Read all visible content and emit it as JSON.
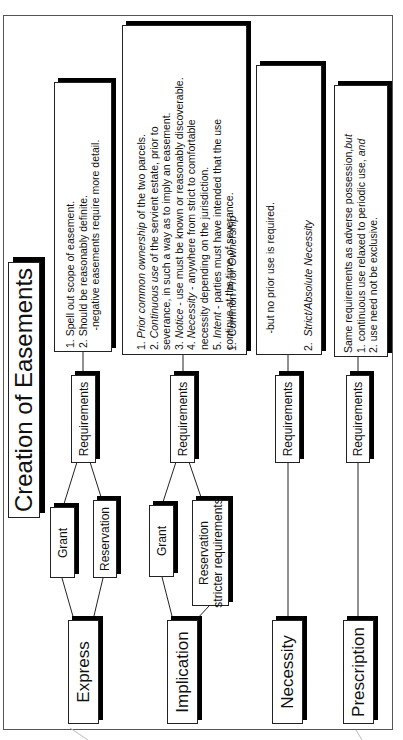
{
  "title": "Creation of Easements",
  "methods": [
    {
      "id": "express",
      "label": "Express",
      "requirements_label": "Requirements",
      "subtypes": [
        {
          "label": "Grant"
        },
        {
          "label": "Reservation"
        }
      ],
      "requirements_text": [
        "1.  Spell out scope of easement.",
        "2.  Should be reasonably definite.",
        "      -negative easements require more detail."
      ]
    },
    {
      "id": "implication",
      "label": "Implication",
      "requirements_label": "Requirements",
      "subtypes": [
        {
          "label": "Grant"
        },
        {
          "label": "Reservation",
          "sublabel": "stricter requirements"
        }
      ],
      "requirements_text": [
        {
          "num": "1. ",
          "italic": "Prior common ownership",
          "rest": " of the two parcels."
        },
        {
          "num": "2. ",
          "italic": "Continuous use",
          "rest": " of the servient estate, prior to"
        },
        {
          "num": "",
          "italic": "",
          "rest": "severance, in such a way as to imply an  easement."
        },
        {
          "num": "3. ",
          "italic": "Notice",
          "rest": " - use must be known or reasonably discoverable."
        },
        {
          "num": "4. ",
          "italic": "Necessity",
          "rest": " - anywhere from strict to comfortable"
        },
        {
          "num": "",
          "italic": "",
          "rest": "necessity depending on the jurisdiction."
        },
        {
          "num": "5. ",
          "italic": "Intent",
          "rest": " - parties must have intended that the use"
        },
        {
          "num": "",
          "italic": "",
          "rest": "continue at the time of severance."
        }
      ]
    },
    {
      "id": "necessity",
      "label": "Necessity",
      "requirements_label": "Requirements",
      "requirements_text": [
        {
          "num": "1.  ",
          "plain": "Common ",
          "italic": "Prior Ownership",
          "rest": ""
        },
        {
          "num": "",
          "plain": "      -but no prior use is required.",
          "italic": "",
          "rest": ""
        },
        {
          "num": "2.  ",
          "plain": "",
          "italic": "Strict/Absolute Necessity",
          "rest": ""
        },
        {
          "num": "",
          "plain": "      -easement only lasts as long as necessity does.",
          "italic": "",
          "rest": ""
        }
      ]
    },
    {
      "id": "prescription",
      "label": "Prescription",
      "requirements_label": "Requirements",
      "requirements_text": [
        {
          "plain": "Same requirements as adverse possession,",
          "italic": "but"
        },
        {
          "plain": "1. continuous use relaxed to periodic use, ",
          "italic": "and"
        },
        {
          "plain": "2. use need not be exclusive.",
          "italic": ""
        }
      ]
    }
  ]
}
